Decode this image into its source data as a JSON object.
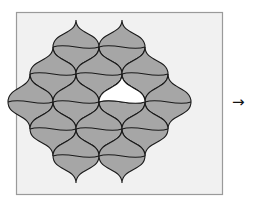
{
  "figure": {
    "colors": {
      "frame_fill": "#f1f1f1",
      "frame_stroke": "#9a9a9a",
      "tile_fill": "#a6a6a6",
      "tile_stroke": "#1a1a1a",
      "hole_fill": "#ffffff",
      "arrow": "#111111"
    },
    "frame": {
      "x": 16,
      "y": 12,
      "w": 206,
      "h": 182
    },
    "lattice": {
      "rows": [
        {
          "y": 20,
          "xs": [
            76,
            122
          ]
        },
        {
          "y": 47,
          "xs": [
            53,
            99,
            145
          ]
        },
        {
          "y": 74,
          "xs": [
            30,
            76,
            122,
            168
          ]
        },
        {
          "y": 102,
          "xs": [
            8,
            53,
            99,
            145,
            191
          ]
        },
        {
          "y": 129,
          "xs": [
            30,
            76,
            122,
            168
          ]
        },
        {
          "y": 156,
          "xs": [
            53,
            99,
            145
          ]
        },
        {
          "y": 183,
          "xs": [
            76,
            122
          ]
        }
      ],
      "missing_half_tile": {
        "top": [
          122,
          74
        ],
        "left": [
          99,
          102
        ],
        "right": [
          145,
          102
        ]
      }
    },
    "arrow": {
      "glyph": "→",
      "x": 232,
      "y": 102
    }
  }
}
